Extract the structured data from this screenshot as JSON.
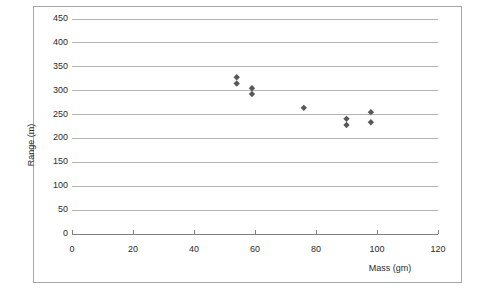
{
  "chart_data": {
    "type": "scatter",
    "title": "",
    "xlabel": "Mass (gm)",
    "ylabel": "Range (m)",
    "xlim": [
      0,
      120
    ],
    "ylim": [
      0,
      450
    ],
    "xticks": [
      0,
      20,
      40,
      60,
      80,
      100,
      120
    ],
    "yticks": [
      0,
      50,
      100,
      150,
      200,
      250,
      300,
      350,
      400,
      450
    ],
    "grid": "horizontal",
    "legend": "none",
    "marker": "diamond",
    "marker_color": "#595959",
    "series": [
      {
        "name": "Range vs Mass",
        "points": [
          {
            "x": 54,
            "y": 328
          },
          {
            "x": 54,
            "y": 315
          },
          {
            "x": 59,
            "y": 305
          },
          {
            "x": 59,
            "y": 293
          },
          {
            "x": 76,
            "y": 264
          },
          {
            "x": 90,
            "y": 241
          },
          {
            "x": 90,
            "y": 228
          },
          {
            "x": 98,
            "y": 255
          },
          {
            "x": 98,
            "y": 234
          }
        ]
      }
    ]
  },
  "colors": {
    "frame_border": "#a6a6a6",
    "gridline": "#b3b3b3",
    "axis": "#808080",
    "text": "#2b2b2b",
    "marker": "#595959",
    "background": "#ffffff"
  }
}
